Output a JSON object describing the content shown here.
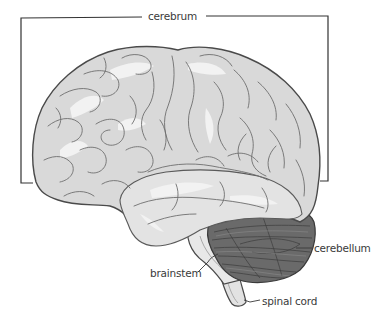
{
  "diagram": {
    "labels": {
      "cerebrum": "cerebrum",
      "cerebellum": "cerebellum",
      "brainstem": "brainstem",
      "spinal_cord": "spinal cord"
    },
    "colors": {
      "cerebrum_fill": "#d9d9d9",
      "cerebrum_highlight": "#efefef",
      "gyri_lines": "#6e6e6e",
      "outline": "#4a4a4a",
      "cerebellum_fill": "#6a6a6a",
      "cerebellum_lines": "#3c3c3c",
      "brainstem_fill": "#e6e6e6",
      "bracket": "#333333",
      "label_text": "#3a3a3a"
    }
  }
}
